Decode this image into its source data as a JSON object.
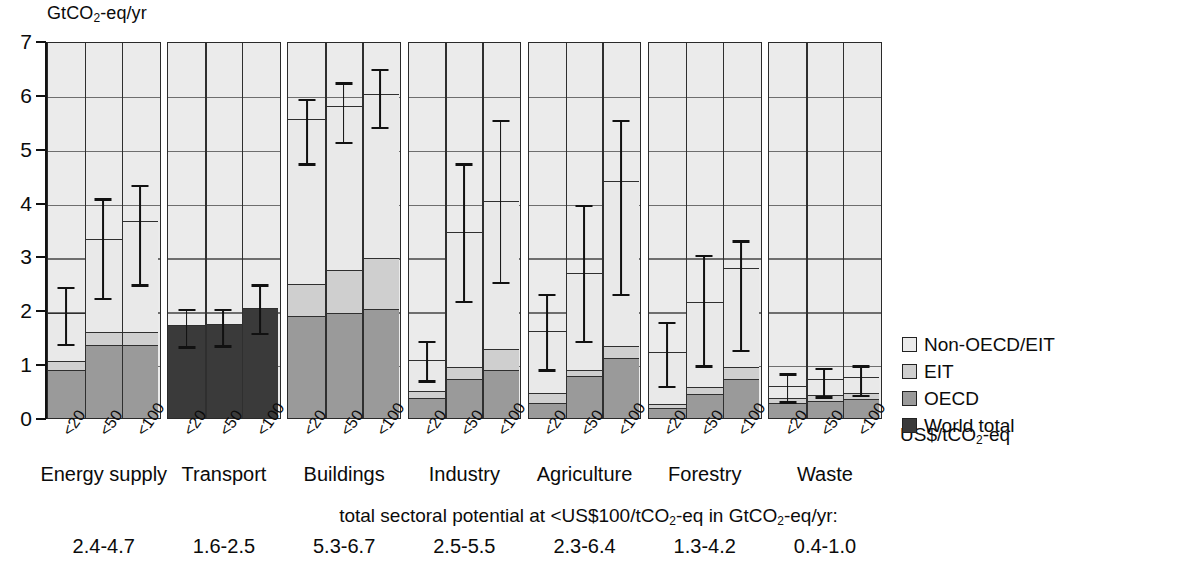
{
  "axis": {
    "y_unit": "GtCO",
    "y_unit_sub": "2",
    "y_unit_tail": "-eq/yr",
    "y_ticks": [
      "7",
      "6",
      "5",
      "4",
      "3",
      "2",
      "1",
      "0"
    ],
    "x_caption": "US$/tCO",
    "x_caption_sub": "2",
    "x_caption_tail": "-eq",
    "x_tick_labels": [
      "<20",
      "<50",
      "<100"
    ]
  },
  "legend": {
    "title": "",
    "items": [
      {
        "label": "Non-OECD/EIT",
        "key": "nonoecd",
        "color": "#ebebeb"
      },
      {
        "label": "EIT",
        "key": "eit",
        "color": "#cfcfcf"
      },
      {
        "label": "OECD",
        "key": "oecd",
        "color": "#9a9a9a"
      },
      {
        "label": "World total",
        "key": "world",
        "color": "#3a3a3a"
      }
    ]
  },
  "footer": {
    "caption_a": "total sectoral potential at <US$100/tCO",
    "caption_sub": "2",
    "caption_b": "-eq in GtCO",
    "caption_sub2": "2",
    "caption_c": "-eq/yr:",
    "totals": [
      "2.4-4.7",
      "1.6-2.5",
      "5.3-6.7",
      "2.5-5.5",
      "2.3-6.4",
      "1.3-4.2",
      "0.4-1.0"
    ]
  },
  "chart_data": {
    "type": "bar",
    "title": "",
    "subtitle": "",
    "xlabel": "US$/tCO2-eq",
    "ylabel": "GtCO2-eq/yr",
    "ylim": [
      0,
      7
    ],
    "ytick_values": [
      0,
      1,
      2,
      3,
      4,
      5,
      6,
      7
    ],
    "grid": "horizontal",
    "legend_position": "right",
    "stacking": "stacked",
    "series_order": [
      "World total",
      "OECD",
      "EIT",
      "Non-OECD/EIT"
    ],
    "categories": [
      "<20",
      "<50",
      "<100"
    ],
    "panels": [
      {
        "name": "Energy supply",
        "total_range": "2.4-4.7",
        "bars": [
          {
            "category": "<20",
            "world": 0,
            "oecd": 0.9,
            "eit": 0.15,
            "nonoecd": 0.9,
            "total": 1.95,
            "err_low": 1.4,
            "err_high": 2.45
          },
          {
            "category": "<50",
            "world": 0,
            "oecd": 1.35,
            "eit": 0.25,
            "nonoecd": 1.72,
            "total": 3.32,
            "err_low": 2.25,
            "err_high": 4.1
          },
          {
            "category": "<100",
            "world": 0,
            "oecd": 1.35,
            "eit": 0.25,
            "nonoecd": 2.05,
            "total": 3.65,
            "err_low": 2.5,
            "err_high": 4.35
          }
        ]
      },
      {
        "name": "Transport",
        "total_range": "1.6-2.5",
        "bars": [
          {
            "category": "<20",
            "world": 1.72,
            "oecd": 0,
            "eit": 0,
            "nonoecd": 0,
            "total": 1.72,
            "err_low": 1.35,
            "err_high": 2.05
          },
          {
            "category": "<50",
            "world": 1.75,
            "oecd": 0,
            "eit": 0,
            "nonoecd": 0,
            "total": 1.75,
            "err_low": 1.37,
            "err_high": 2.05
          },
          {
            "category": "<100",
            "world": 2.05,
            "oecd": 0,
            "eit": 0,
            "nonoecd": 0,
            "total": 2.05,
            "err_low": 1.6,
            "err_high": 2.5
          }
        ]
      },
      {
        "name": "Buildings",
        "total_range": "5.3-6.7",
        "bars": [
          {
            "category": "<20",
            "world": 0,
            "oecd": 1.9,
            "eit": 0.58,
            "nonoecd": 3.07,
            "total": 5.55,
            "err_low": 4.75,
            "err_high": 5.95
          },
          {
            "category": "<50",
            "world": 0,
            "oecd": 1.95,
            "eit": 0.8,
            "nonoecd": 3.05,
            "total": 5.8,
            "err_low": 5.15,
            "err_high": 6.25
          },
          {
            "category": "<100",
            "world": 0,
            "oecd": 2.02,
            "eit": 0.95,
            "nonoecd": 3.05,
            "total": 6.02,
            "err_low": 5.42,
            "err_high": 6.5
          }
        ]
      },
      {
        "name": "Industry",
        "total_range": "2.5-5.5",
        "bars": [
          {
            "category": "<20",
            "world": 0,
            "oecd": 0.38,
            "eit": 0.12,
            "nonoecd": 0.58,
            "total": 1.08,
            "err_low": 0.72,
            "err_high": 1.45
          },
          {
            "category": "<50",
            "world": 0,
            "oecd": 0.72,
            "eit": 0.22,
            "nonoecd": 2.52,
            "total": 3.46,
            "err_low": 2.2,
            "err_high": 4.75
          },
          {
            "category": "<100",
            "world": 0,
            "oecd": 0.9,
            "eit": 0.38,
            "nonoecd": 2.75,
            "total": 4.03,
            "err_low": 2.55,
            "err_high": 5.55
          }
        ]
      },
      {
        "name": "Agriculture",
        "total_range": "2.3-6.4",
        "bars": [
          {
            "category": "<20",
            "world": 0,
            "oecd": 0.28,
            "eit": 0.18,
            "nonoecd": 1.16,
            "total": 1.62,
            "err_low": 0.92,
            "err_high": 2.32
          },
          {
            "category": "<50",
            "world": 0,
            "oecd": 0.78,
            "eit": 0.12,
            "nonoecd": 1.8,
            "total": 2.7,
            "err_low": 1.45,
            "err_high": 3.98
          },
          {
            "category": "<100",
            "world": 0,
            "oecd": 1.12,
            "eit": 0.22,
            "nonoecd": 3.06,
            "total": 4.4,
            "err_low": 2.32,
            "err_high": 5.55
          }
        ]
      },
      {
        "name": "Forestry",
        "total_range": "1.3-4.2",
        "bars": [
          {
            "category": "<20",
            "world": 0,
            "oecd": 0.18,
            "eit": 0.08,
            "nonoecd": 0.96,
            "total": 1.22,
            "err_low": 0.62,
            "err_high": 1.8
          },
          {
            "category": "<50",
            "world": 0,
            "oecd": 0.45,
            "eit": 0.13,
            "nonoecd": 1.57,
            "total": 2.15,
            "err_low": 1.0,
            "err_high": 3.05
          },
          {
            "category": "<100",
            "world": 0,
            "oecd": 0.72,
            "eit": 0.22,
            "nonoecd": 1.84,
            "total": 2.78,
            "err_low": 1.28,
            "err_high": 3.32
          }
        ]
      },
      {
        "name": "Waste",
        "total_range": "0.4-1.0",
        "bars": [
          {
            "category": "<20",
            "world": 0,
            "oecd": 0.28,
            "eit": 0.1,
            "nonoecd": 0.22,
            "total": 0.6,
            "err_low": 0.33,
            "err_high": 0.85
          },
          {
            "category": "<50",
            "world": 0,
            "oecd": 0.32,
            "eit": 0.1,
            "nonoecd": 0.3,
            "total": 0.72,
            "err_low": 0.42,
            "err_high": 0.95
          },
          {
            "category": "<100",
            "world": 0,
            "oecd": 0.35,
            "eit": 0.12,
            "nonoecd": 0.3,
            "total": 0.77,
            "err_low": 0.45,
            "err_high": 1.0
          }
        ]
      }
    ]
  }
}
